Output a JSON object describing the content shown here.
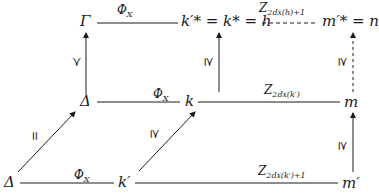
{
  "diagram": {
    "type": "commutative-diagram",
    "nodes": {
      "gamma": "Γ",
      "top_middle": "k′* = k* = h",
      "top_right": "m′* = n",
      "mid_left": "Δ",
      "mid_middle": "k",
      "mid_right": "m",
      "bot_left": "Δ",
      "bot_middle": "k′",
      "bot_right": "m′"
    },
    "edge_labels": {
      "top_left_edge": "Φ",
      "top_left_edge_sub": "X",
      "top_right_edge": "Z",
      "top_right_edge_sub": "2d",
      "top_right_edge_sub2": "X",
      "top_right_edge_tail": "(h)+1",
      "mid_left_edge": "Φ",
      "mid_left_edge_sub": "X",
      "mid_right_edge": "Z",
      "mid_right_edge_sub": "2d",
      "mid_right_edge_sub2": "X",
      "mid_right_edge_tail": "(k′)",
      "bot_left_edge": "Φ",
      "bot_left_edge_sub": "X",
      "bot_right_edge": "Z",
      "bot_right_edge_sub": "2d",
      "bot_right_edge_sub2": "X",
      "bot_right_edge_tail": "(k′)+1",
      "vert_left": "≻",
      "vert_middle": "⪰",
      "vert_right_dashed": "⪰",
      "vert_right_bottom": "⪰",
      "diag_left": "=",
      "diag_middle": "⪰"
    },
    "line_color": "#1a1a1a"
  }
}
